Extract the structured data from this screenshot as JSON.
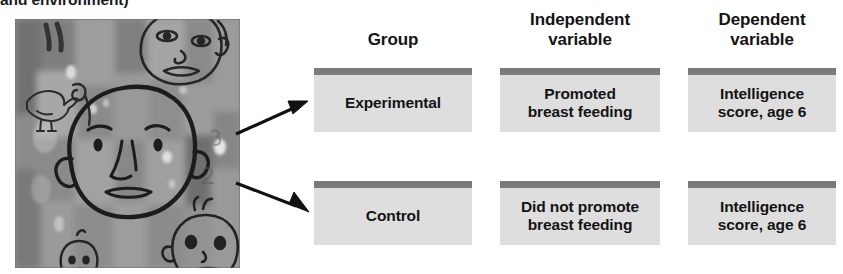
{
  "caption_fragment": "and environment)",
  "photo": {
    "alt_name": "child-artwork-photograph",
    "description": "Grayscale photograph of children's drawings of faces and a bird on a painted wall"
  },
  "diagram": {
    "headers": [
      {
        "lines": [
          "Group"
        ]
      },
      {
        "lines": [
          "Independent",
          "variable"
        ]
      },
      {
        "lines": [
          "Dependent",
          "variable"
        ]
      }
    ],
    "rows": [
      {
        "name": "experimental-row",
        "cells": [
          {
            "lines": [
              "Experimental"
            ]
          },
          {
            "lines": [
              "Promoted",
              "breast feeding"
            ]
          },
          {
            "lines": [
              "Intelligence",
              "score, age 6"
            ]
          }
        ]
      },
      {
        "name": "control-row",
        "cells": [
          {
            "lines": [
              "Control"
            ]
          },
          {
            "lines": [
              "Did not promote",
              "breast feeding"
            ]
          },
          {
            "lines": [
              "Intelligence",
              "score, age 6"
            ]
          }
        ]
      }
    ],
    "colors": {
      "box_fill": "#dedede",
      "box_top_bar": "#7b7b7b",
      "text": "#141414",
      "arrow": "#111111"
    }
  }
}
